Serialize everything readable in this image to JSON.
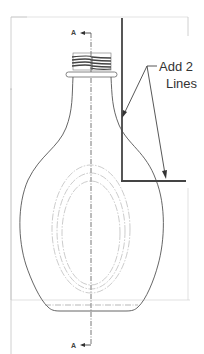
{
  "drawing": {
    "type": "technical-drawing",
    "subject": "bottle-front-view",
    "section_marker": {
      "top_label": "A",
      "bottom_label": "A"
    },
    "callout": {
      "line1": "Add 2",
      "line2": "Lines"
    },
    "colors": {
      "background": "#ffffff",
      "frame": "#bdbdbd",
      "outline": "#555555",
      "hidden": "#aaaaaa",
      "centerline": "#555555",
      "sketch_lines": "#444444",
      "text": "#333333"
    }
  }
}
